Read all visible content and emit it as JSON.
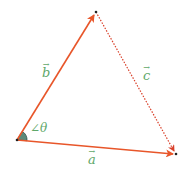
{
  "diagram": {
    "colors": {
      "vector": "#e8562a",
      "dotted": "#d9402a",
      "label": "#5fa86a",
      "angle_fill": "#5c8a7a",
      "point": "#222222"
    },
    "points": {
      "origin": [
        17,
        140
      ],
      "top": [
        96,
        12
      ],
      "right": [
        176,
        154
      ]
    },
    "vectors": [
      {
        "name": "a",
        "from": "origin",
        "to": "right",
        "style": "solid"
      },
      {
        "name": "b",
        "from": "origin",
        "to": "top",
        "style": "solid"
      },
      {
        "name": "c",
        "from": "top",
        "to": "right",
        "style": "dotted"
      }
    ],
    "labels": {
      "a": "a",
      "b": "b",
      "c": "c",
      "angle": "∠θ",
      "arrow": "→"
    }
  }
}
